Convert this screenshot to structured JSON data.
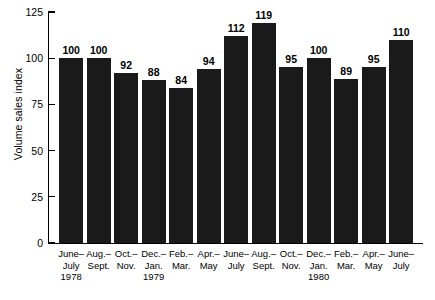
{
  "chart_data": {
    "type": "bar",
    "title": "",
    "xlabel": "",
    "ylabel": "Volume sales index",
    "ylim": [
      0,
      125
    ],
    "yticks": [
      0,
      25,
      50,
      75,
      100,
      125
    ],
    "grid": false,
    "legend": null,
    "bar_color": "#1a1a1a",
    "categories": [
      "June–July 1978",
      "Aug.–Sept.",
      "Oct.–Nov.",
      "Dec.–Jan. 1979",
      "Feb.–Mar.",
      "Apr.–May",
      "June–July",
      "Aug.–Sept.",
      "Oct.–Nov.",
      "Dec.–Jan. 1980",
      "Feb.–Mar.",
      "Apr.–May",
      "June–July"
    ],
    "category_lines": [
      [
        "June–",
        "July",
        "1978"
      ],
      [
        "Aug.–",
        "Sept."
      ],
      [
        "Oct.–",
        "Nov."
      ],
      [
        "Dec.–",
        "Jan.",
        "1979"
      ],
      [
        "Feb.–",
        "Mar."
      ],
      [
        "Apr.–",
        "May"
      ],
      [
        "June–",
        "July"
      ],
      [
        "Aug.–",
        "Sept."
      ],
      [
        "Oct.–",
        "Nov."
      ],
      [
        "Dec.–",
        "Jan.",
        "1980"
      ],
      [
        "Feb.–",
        "Mar."
      ],
      [
        "Apr.–",
        "May"
      ],
      [
        "June–",
        "July"
      ]
    ],
    "values": [
      100,
      100,
      92,
      88,
      84,
      94,
      112,
      119,
      95,
      100,
      89,
      95,
      110
    ],
    "value_labels": [
      "100",
      "100",
      "92",
      "88",
      "84",
      "94",
      "112",
      "119",
      "95",
      "100",
      "89",
      "95",
      "110"
    ],
    "ytick_labels": [
      "0",
      "25",
      "50",
      "75",
      "100",
      "125"
    ]
  }
}
